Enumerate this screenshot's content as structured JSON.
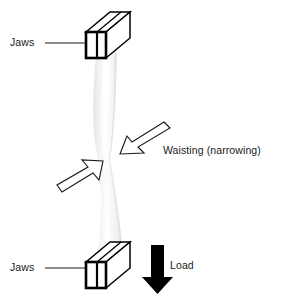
{
  "figure": {
    "width": 281,
    "height": 301,
    "background_color": "#ffffff"
  },
  "labels": {
    "jaws_top": "Jaws",
    "jaws_bottom": "Jaws",
    "waisting": "Waisting (narrowing)",
    "load": "Load"
  },
  "colors": {
    "outline": "#000000",
    "text": "#1a1a1a",
    "specimen_light": "#fbfbfb",
    "specimen_mid": "#ededed",
    "specimen_shadow": "#e2e2e2",
    "load_arrow": "#000000",
    "background": "#ffffff"
  },
  "icons": {
    "jaws_top": "jaw-box-icon",
    "jaws_bottom": "jaw-box-icon",
    "waisting_pointer": "outlined-arrow-down-left-icon",
    "waist_pointer_lower": "outlined-arrow-up-right-icon",
    "load_pointer": "solid-arrow-down-icon",
    "specimen": "waisted-specimen-icon"
  },
  "geometry": {
    "top_jaw": {
      "x": 85,
      "y": 12,
      "width": 45,
      "height": 46
    },
    "bottom_jaw": {
      "x": 85,
      "y": 242,
      "width": 45,
      "height": 46
    },
    "specimen_waist_y": 160,
    "specimen_top_width": 26,
    "specimen_waist_width": 11,
    "load_arrow": {
      "x": 157,
      "y_start": 245,
      "y_end": 292
    }
  }
}
